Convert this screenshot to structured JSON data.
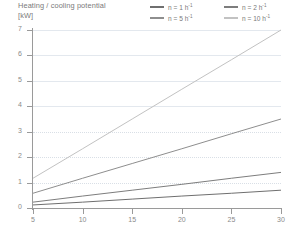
{
  "chart_title": {
    "line1": "Heating / cooling potential",
    "line2": "[kW]"
  },
  "x_axis_title": "Temperature difference indoors / outdoors [K]",
  "legend": {
    "items": [
      {
        "label_prefix": "n = 1 h",
        "exponent": "-1",
        "color": "#6f6f6f"
      },
      {
        "label_prefix": "n = 2 h",
        "exponent": "-1",
        "color": "#7d7d7d"
      },
      {
        "label_prefix": "n = 5 h",
        "exponent": "-1",
        "color": "#8e8e8e"
      },
      {
        "label_prefix": "n = 10 h",
        "exponent": "-1",
        "color": "#c2c2c2"
      }
    ]
  },
  "y_ticks": [
    "0",
    "1",
    "2",
    "3",
    "4",
    "5",
    "6",
    "7"
  ],
  "x_ticks": [
    "5",
    "10",
    "15",
    "20",
    "25",
    "30"
  ],
  "chart_data": {
    "type": "line",
    "title": "Heating / cooling potential [kW]",
    "xlabel": "Temperature difference indoors / outdoors [K]",
    "ylabel": "Heating / cooling potential [kW]",
    "xlim": [
      5,
      30
    ],
    "ylim": [
      0,
      7
    ],
    "xticks": [
      5,
      10,
      15,
      20,
      25,
      30
    ],
    "yticks": [
      0,
      1,
      2,
      3,
      4,
      5,
      6,
      7
    ],
    "grid": "horizontal-dotted",
    "legend_position": "top-right",
    "x": [
      5,
      10,
      15,
      20,
      25,
      30
    ],
    "series": [
      {
        "name": "n = 1 h-1",
        "color": "#6f6f6f",
        "values": [
          0.12,
          0.23,
          0.35,
          0.47,
          0.58,
          0.7
        ]
      },
      {
        "name": "n = 2 h-1",
        "color": "#7d7d7d",
        "values": [
          0.23,
          0.47,
          0.7,
          0.93,
          1.17,
          1.4
        ]
      },
      {
        "name": "n = 5 h-1",
        "color": "#8e8e8e",
        "values": [
          0.58,
          1.17,
          1.75,
          2.33,
          2.92,
          3.5
        ]
      },
      {
        "name": "n = 10 h-1",
        "color": "#c2c2c2",
        "values": [
          1.17,
          2.33,
          3.5,
          4.67,
          5.83,
          7.0
        ]
      }
    ]
  }
}
